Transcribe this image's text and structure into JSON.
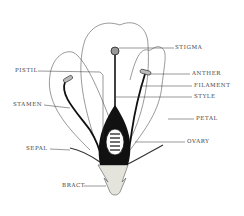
{
  "diagram": {
    "labels": [
      {
        "id": "stigma",
        "text": "STIGMA",
        "x": 175,
        "y": 45
      },
      {
        "id": "pistil",
        "text": "PISTIL",
        "x": 15,
        "y": 68
      },
      {
        "id": "anther",
        "text": "ANTHER",
        "x": 192,
        "y": 71
      },
      {
        "id": "filament",
        "text": "FILAMENT",
        "x": 194,
        "y": 83
      },
      {
        "id": "style",
        "text": "STYLE",
        "x": 194,
        "y": 94
      },
      {
        "id": "stamen",
        "text": "STAMEN",
        "x": 13,
        "y": 102
      },
      {
        "id": "petal",
        "text": "PETAL",
        "x": 196,
        "y": 116
      },
      {
        "id": "sepal",
        "text": "SEPAL",
        "x": 26,
        "y": 146
      },
      {
        "id": "ovary",
        "text": "OVARY",
        "x": 187,
        "y": 139
      },
      {
        "id": "bract",
        "text": "BRACT",
        "x": 62,
        "y": 183
      }
    ],
    "colors": {
      "line": "#333333",
      "fill_dark": "#111111",
      "bract_fill": "#e4e4dc",
      "background": "#ffffff"
    }
  }
}
